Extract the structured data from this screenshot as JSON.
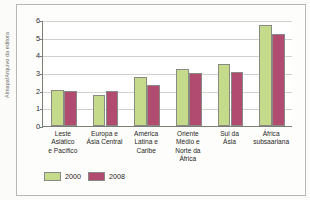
{
  "credit": {
    "text": "Almapa/Arquivo da editora"
  },
  "chart_data": {
    "type": "bar",
    "title": "",
    "subtitle": "",
    "xlabel": "",
    "ylabel": "",
    "ylim": [
      0,
      6
    ],
    "yticks": [
      0,
      1,
      2,
      3,
      4,
      5,
      6
    ],
    "ytick_labels": [
      "0",
      "1",
      "2",
      "3",
      "4",
      "5",
      "6"
    ],
    "grid": true,
    "legend_position": "bottom-left",
    "categories": [
      "Leste Asiático e Pacífico",
      "Europa e Ásia Central",
      "América Latina e Caribe",
      "Oriente Médio e Norte da África",
      "Sul da Ásia",
      "África subsaariana"
    ],
    "category_lines": [
      [
        "Leste",
        "Asiático",
        "e Pacífico"
      ],
      [
        "Europa e",
        "Ásia Central"
      ],
      [
        "América",
        "Latina e",
        "Caribe"
      ],
      [
        "Oriente",
        "Médio e",
        "Norte da",
        "África"
      ],
      [
        "Sul da",
        "Ásia"
      ],
      [
        "África",
        "subsaariana"
      ]
    ],
    "series": [
      {
        "name": "2000",
        "color": "#c6da8c",
        "values": [
          2.02,
          1.77,
          2.78,
          3.25,
          3.5,
          5.7
        ]
      },
      {
        "name": "2008",
        "color": "#b24b70",
        "values": [
          2.0,
          1.98,
          2.3,
          3.0,
          3.06,
          5.2
        ]
      }
    ]
  }
}
